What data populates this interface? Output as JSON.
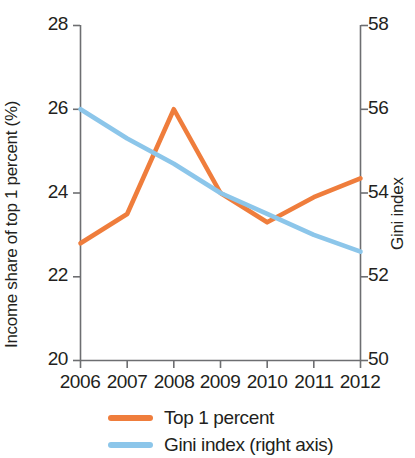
{
  "chart_data": {
    "type": "line",
    "title": "",
    "xlabel": "",
    "ylabel": "Income share of top 1 percent (%)",
    "y2label": "Gini index",
    "categories": [
      "2006",
      "2007",
      "2008",
      "2009",
      "2010",
      "2011",
      "2012"
    ],
    "x": [
      2006,
      2007,
      2008,
      2009,
      2010,
      2011,
      2012
    ],
    "ylim": [
      20,
      28
    ],
    "y2lim": [
      50,
      58
    ],
    "yticks": [
      "20",
      "22",
      "24",
      "26",
      "28"
    ],
    "ytick_values": [
      20,
      22,
      24,
      26,
      28
    ],
    "y2ticks": [
      "50",
      "52",
      "54",
      "56",
      "58"
    ],
    "y2tick_values": [
      50,
      52,
      54,
      56,
      58
    ],
    "grid": false,
    "legend_position": "bottom",
    "series": [
      {
        "name": "Top 1 percent",
        "axis": "left",
        "color": "#ef7d3c",
        "values": [
          22.8,
          23.5,
          26.0,
          24.0,
          23.3,
          23.9,
          24.35
        ]
      },
      {
        "name": "Gini index (right axis)",
        "axis": "right",
        "color": "#8cc6ea",
        "values": [
          56.0,
          55.3,
          54.7,
          54.0,
          53.5,
          53.0,
          52.6
        ]
      }
    ]
  },
  "legend": {
    "items": [
      {
        "label": "Top 1 percent",
        "color": "#ef7d3c"
      },
      {
        "label": "Gini index (right axis)",
        "color": "#8cc6ea"
      }
    ]
  },
  "axes": {
    "left_title": "Income share of top 1 percent (%)",
    "right_title": "Gini index",
    "left_ticks": [
      "28",
      "26",
      "24",
      "22",
      "20"
    ],
    "right_ticks": [
      "58",
      "56",
      "54",
      "52",
      "50"
    ],
    "x_ticks": [
      "2006",
      "2007",
      "2008",
      "2009",
      "2010",
      "2011",
      "2012"
    ]
  }
}
